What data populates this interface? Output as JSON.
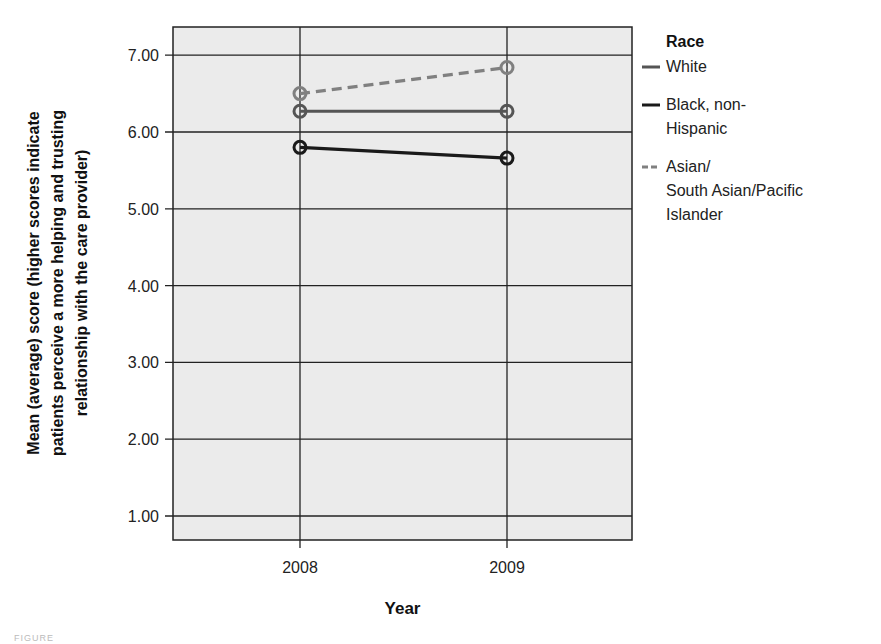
{
  "chart_data": {
    "type": "line",
    "title": "",
    "xlabel": "Year",
    "ylabel": "Mean (average) score (higher scores indicate patients perceive a more helping and trusting relationship with the care provider)",
    "ylabel_lines": [
      "Mean (average) score (higher scores indicate",
      "patients perceive a more helping and trusting",
      "relationship with the care provider)"
    ],
    "x": [
      "2008",
      "2009"
    ],
    "yticks": [
      "1.00",
      "2.00",
      "3.00",
      "4.00",
      "5.00",
      "6.00",
      "7.00"
    ],
    "ylim": [
      0.7,
      7.35
    ],
    "grid": true,
    "legend_position": "right",
    "legend_title": "Race",
    "series": [
      {
        "name": "White",
        "label_lines": [
          "White"
        ],
        "values": [
          6.27,
          6.27
        ],
        "color": "#555555",
        "dash": false
      },
      {
        "name": "Black, non-Hispanic",
        "label_lines": [
          "Black, non-",
          "Hispanic"
        ],
        "values": [
          5.8,
          5.66
        ],
        "color": "#1a1a1a",
        "dash": false
      },
      {
        "name": "Asian/South Asian/Pacific Islander",
        "label_lines": [
          "Asian/",
          "South Asian/Pacific",
          "Islander"
        ],
        "values": [
          6.5,
          6.84
        ],
        "color": "#808080",
        "dash": true
      }
    ]
  },
  "caption": "FIGURE"
}
